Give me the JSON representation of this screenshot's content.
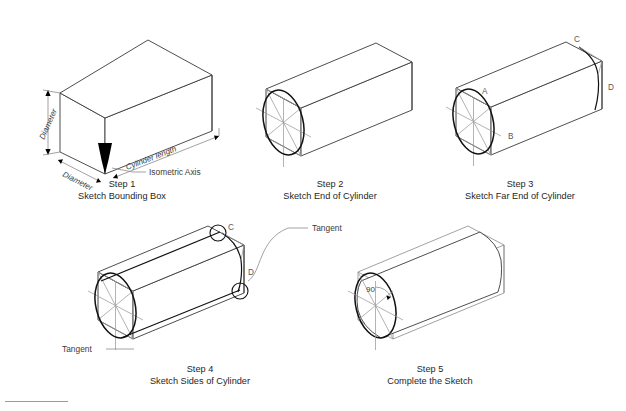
{
  "figure": {
    "background_color": "#ffffff",
    "line_color": "#3a3a3a",
    "construction_color": "#9a9a9a",
    "curve_color": "#111111",
    "annotation_color": "#3c3c3c"
  },
  "steps": [
    {
      "id": "step-1",
      "number_label": "Step 1",
      "description": "Sketch Bounding Box",
      "annotations": [
        {
          "name": "diameter-vertical",
          "text": "Diameter"
        },
        {
          "name": "diameter-horizontal",
          "text": "Diameter"
        },
        {
          "name": "cylinder-length",
          "text": "Cylinder length"
        },
        {
          "name": "isometric-axis",
          "text": "Isometric Axis"
        }
      ]
    },
    {
      "id": "step-2",
      "number_label": "Step 2",
      "description": "Sketch End of Cylinder",
      "annotations": []
    },
    {
      "id": "step-3",
      "number_label": "Step 3",
      "description": "Sketch Far End of Cylinder",
      "annotations": [
        {
          "name": "point-a",
          "text": "A"
        },
        {
          "name": "point-b",
          "text": "B"
        },
        {
          "name": "point-c",
          "text": "C"
        },
        {
          "name": "point-d",
          "text": "D"
        }
      ]
    },
    {
      "id": "step-4",
      "number_label": "Step 4",
      "description": "Sketch Sides of Cylinder",
      "annotations": [
        {
          "name": "tangent-upper",
          "text": "Tangent"
        },
        {
          "name": "tangent-lower",
          "text": "Tangent"
        },
        {
          "name": "point-c",
          "text": "C"
        },
        {
          "name": "point-d",
          "text": "D"
        }
      ]
    },
    {
      "id": "step-5",
      "number_label": "Step 5",
      "description": "Complete the Sketch",
      "annotations": [
        {
          "name": "right-angle",
          "text": "90"
        }
      ]
    }
  ],
  "labels": {
    "step1_num": "Step 1",
    "step1_desc": "Sketch Bounding Box",
    "step2_num": "Step 2",
    "step2_desc": "Sketch End of Cylinder",
    "step3_num": "Step 3",
    "step3_desc": "Sketch Far End of Cylinder",
    "step4_num": "Step 4",
    "step4_desc": "Sketch Sides of Cylinder",
    "step5_num": "Step 5",
    "step5_desc": "Complete the Sketch",
    "diameter_v": "Diameter",
    "diameter_h": "Diameter",
    "cylinder_length": "Cylinder length",
    "isometric_axis": "Isometric Axis",
    "tangent_top": "Tangent",
    "tangent_bottom": "Tangent",
    "pt_a": "A",
    "pt_b": "B",
    "pt_c3": "C",
    "pt_d3": "D",
    "pt_c4": "C",
    "pt_d4": "D",
    "angle_90": "90"
  }
}
